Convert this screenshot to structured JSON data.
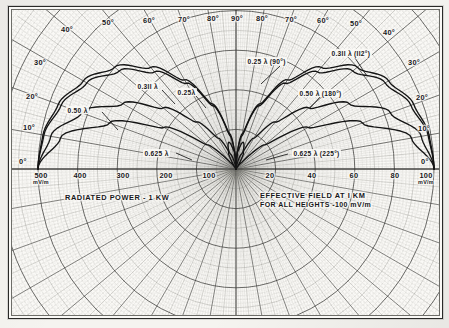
{
  "axes": {
    "left_scale_name": "RADIATED POWER - 1 KW",
    "right_scale_name_line1": "EFFECTIVE FIELD AT I KM",
    "right_scale_name_line2": "FOR ALL HEIGHTS -100 mV/m",
    "left_ticks": [
      {
        "label": "500",
        "unit": "mV/m",
        "value": 500
      },
      {
        "label": "400",
        "unit": "",
        "value": 400
      },
      {
        "label": "300",
        "unit": "",
        "value": 300
      },
      {
        "label": "200",
        "unit": "",
        "value": 200
      },
      {
        "label": "100",
        "unit": "",
        "value": 100
      }
    ],
    "right_ticks": [
      {
        "label": "20",
        "unit": "",
        "value": 20
      },
      {
        "label": "40",
        "unit": "",
        "value": 40
      },
      {
        "label": "60",
        "unit": "",
        "value": 60
      },
      {
        "label": "80",
        "unit": "",
        "value": 80
      },
      {
        "label": "100",
        "unit": "mV/m",
        "value": 100
      }
    ],
    "elevation_left": [
      "0°",
      "10°",
      "20°",
      "30°",
      "40°",
      "50°",
      "60°",
      "70°",
      "80°",
      "90°"
    ],
    "elevation_right": [
      "90°",
      "80°",
      "70°",
      "60°",
      "50°",
      "40°",
      "30°",
      "20°",
      "10°",
      "0°"
    ]
  },
  "curve_labels_left": [
    {
      "text": "0.50  λ",
      "name": "curve-label-050-left"
    },
    {
      "text": "0.3II  λ",
      "name": "curve-label-0311-left"
    },
    {
      "text": "0.25λ",
      "name": "curve-label-025-left"
    },
    {
      "text": "0.625 λ",
      "name": "curve-label-0625-left"
    }
  ],
  "curve_labels_right": [
    {
      "text": "0.25 λ  (90°)",
      "name": "curve-label-025-right"
    },
    {
      "text": "0.3II λ  (II2°)",
      "name": "curve-label-0311-right"
    },
    {
      "text": "0.50  λ  (180°)",
      "name": "curve-label-050-right"
    },
    {
      "text": "0.625 λ  (225°)",
      "name": "curve-label-0625-right"
    }
  ],
  "chart_data": {
    "type": "line",
    "subtitle": "Polar / bipolar nomograph on logarithmic-radial grid",
    "xlabel": "",
    "ylabel": "",
    "projection": "polar-semicircle",
    "grid": true,
    "legend_position": "inline-annotations",
    "origin_px": {
      "x": 232,
      "y": 165
    },
    "axis_ranges": {
      "elevation_deg": [
        0,
        90
      ],
      "left_field_mV_per_m": [
        0,
        500
      ],
      "right_field_mV_per_m": [
        0,
        100
      ]
    },
    "series": [
      {
        "name": "0.25 λ  (90°)",
        "height_wavelengths": 0.25,
        "electrical_degrees": 90,
        "side": "both",
        "pattern_deg_value": [
          {
            "elev": 0,
            "rel": 1.0
          },
          {
            "elev": 10,
            "rel": 0.985
          },
          {
            "elev": 20,
            "rel": 0.94
          },
          {
            "elev": 30,
            "rel": 0.87
          },
          {
            "elev": 40,
            "rel": 0.77
          },
          {
            "elev": 50,
            "rel": 0.64
          },
          {
            "elev": 60,
            "rel": 0.5
          },
          {
            "elev": 70,
            "rel": 0.34
          },
          {
            "elev": 80,
            "rel": 0.17
          },
          {
            "elev": 90,
            "rel": 0.0
          }
        ]
      },
      {
        "name": "0.3II λ  (II2°)",
        "height_wavelengths": 0.311,
        "electrical_degrees": 112,
        "side": "both",
        "pattern_deg_value": [
          {
            "elev": 0,
            "rel": 1.0
          },
          {
            "elev": 10,
            "rel": 0.99
          },
          {
            "elev": 20,
            "rel": 0.955
          },
          {
            "elev": 30,
            "rel": 0.89
          },
          {
            "elev": 40,
            "rel": 0.8
          },
          {
            "elev": 50,
            "rel": 0.67
          },
          {
            "elev": 60,
            "rel": 0.52
          },
          {
            "elev": 70,
            "rel": 0.35
          },
          {
            "elev": 80,
            "rel": 0.18
          },
          {
            "elev": 90,
            "rel": 0.0
          }
        ]
      },
      {
        "name": "0.50  λ  (180°)",
        "height_wavelengths": 0.5,
        "electrical_degrees": 180,
        "side": "both",
        "pattern_deg_value": [
          {
            "elev": 0,
            "rel": 1.0
          },
          {
            "elev": 10,
            "rel": 0.95
          },
          {
            "elev": 20,
            "rel": 0.83
          },
          {
            "elev": 30,
            "rel": 0.66
          },
          {
            "elev": 40,
            "rel": 0.48
          },
          {
            "elev": 50,
            "rel": 0.31
          },
          {
            "elev": 60,
            "rel": 0.18
          },
          {
            "elev": 70,
            "rel": 0.08
          },
          {
            "elev": 80,
            "rel": 0.02
          },
          {
            "elev": 90,
            "rel": 0.0
          }
        ]
      },
      {
        "name": "0.625 λ  (225°)",
        "height_wavelengths": 0.625,
        "electrical_degrees": 225,
        "side": "both",
        "has_minor_lobe": true,
        "pattern_deg_value": [
          {
            "elev": 0,
            "rel": 1.0
          },
          {
            "elev": 10,
            "rel": 0.9
          },
          {
            "elev": 20,
            "rel": 0.68
          },
          {
            "elev": 30,
            "rel": 0.42
          },
          {
            "elev": 40,
            "rel": 0.19
          },
          {
            "elev": 50,
            "rel": 0.04
          },
          {
            "elev": 57,
            "rel": 0.0
          },
          {
            "elev": 65,
            "rel": 0.09
          },
          {
            "elev": 75,
            "rel": 0.14
          },
          {
            "elev": 85,
            "rel": 0.09
          },
          {
            "elev": 90,
            "rel": 0.0
          }
        ]
      }
    ]
  }
}
